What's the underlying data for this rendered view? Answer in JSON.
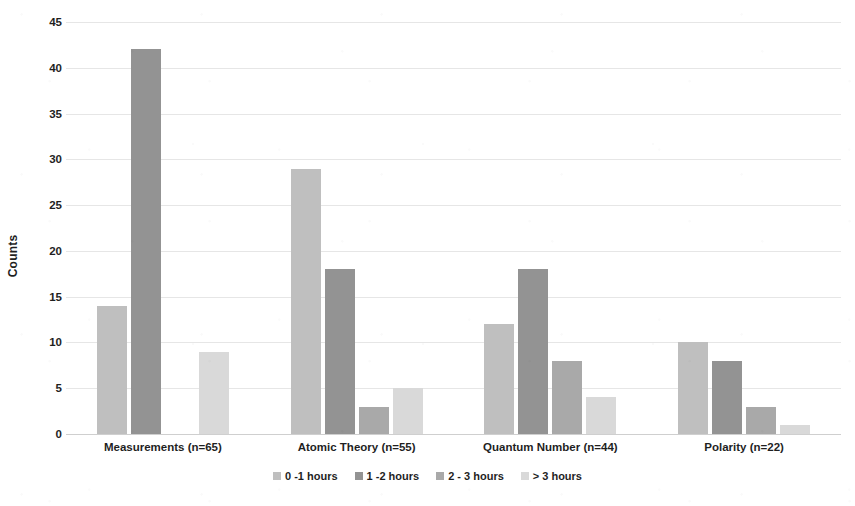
{
  "chart_data": {
    "type": "bar",
    "title": "",
    "xlabel": "",
    "ylabel": "Counts",
    "ylim": [
      0,
      45
    ],
    "ytick_step": 5,
    "yticks": [
      "45",
      "40",
      "35",
      "30",
      "25",
      "20",
      "15",
      "10",
      "5",
      "0"
    ],
    "grid": true,
    "legend_position": "bottom",
    "grouping": "grouped",
    "categories": [
      "Measurements (n=65)",
      "Atomic Theory (n=55)",
      "Quantum Number (n=44)",
      "Polarity (n=22)"
    ],
    "series": [
      {
        "name": "0 -1 hours",
        "color": "#bfbfbf",
        "values": [
          14,
          29,
          12,
          10
        ]
      },
      {
        "name": "1 -2 hours",
        "color": "#939393",
        "values": [
          42,
          18,
          18,
          8
        ]
      },
      {
        "name": "2 - 3 hours",
        "color": "#a9a9a9",
        "values": [
          0,
          3,
          8,
          3
        ]
      },
      {
        "name": "> 3 hours",
        "color": "#d9d9d9",
        "values": [
          9,
          5,
          4,
          1
        ]
      }
    ]
  },
  "axis": {
    "y_title": "Counts"
  },
  "colors": {
    "gridline": "#e6e6e6",
    "baseline": "#cfcfcf",
    "text": "#1f1f1f",
    "background": "#ffffff"
  }
}
